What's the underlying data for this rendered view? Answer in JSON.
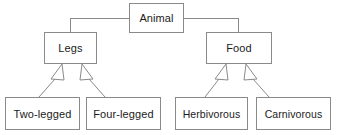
{
  "diagram": {
    "title": "Animal",
    "type": "generalization-hierarchy",
    "colors": {
      "background": "#ffffff",
      "box_border": "#8a8a8a",
      "box_fill": "#ffffff",
      "connector": "#8a8a8a",
      "arrowhead_fill": "#ffffff",
      "arrowhead_stroke": "#8a8a8a",
      "text": "#1b1b1b"
    },
    "nodes": {
      "root": {
        "id": "animal",
        "label": "Animal",
        "x": 129,
        "y": 3,
        "w": 55,
        "h": 30
      },
      "legs": {
        "id": "legs",
        "label": "Legs",
        "x": 44,
        "y": 32,
        "w": 53,
        "h": 32
      },
      "food": {
        "id": "food",
        "label": "Food",
        "x": 206,
        "y": 32,
        "w": 66,
        "h": 32
      },
      "two_legged": {
        "id": "two-legged",
        "label": "Two-legged",
        "x": 5,
        "y": 97,
        "w": 75,
        "h": 33
      },
      "four_legged": {
        "id": "four-legged",
        "label": "Four-legged",
        "x": 86,
        "y": 97,
        "w": 75,
        "h": 33
      },
      "herbivorous": {
        "id": "herbivorous",
        "label": "Herbivorous",
        "x": 175,
        "y": 97,
        "w": 73,
        "h": 33
      },
      "carnivorous": {
        "id": "carnivorous",
        "label": "Carnivorous",
        "x": 256,
        "y": 97,
        "w": 75,
        "h": 33
      }
    },
    "edges": [
      {
        "from": "animal",
        "to": "legs",
        "style": "orthogonal",
        "arrow": "none"
      },
      {
        "from": "animal",
        "to": "food",
        "style": "orthogonal",
        "arrow": "none"
      },
      {
        "from": "legs",
        "to": "two-legged",
        "style": "diagonal",
        "arrow": "hollow-triangle"
      },
      {
        "from": "legs",
        "to": "four-legged",
        "style": "diagonal",
        "arrow": "hollow-triangle"
      },
      {
        "from": "food",
        "to": "herbivorous",
        "style": "diagonal",
        "arrow": "hollow-triangle"
      },
      {
        "from": "food",
        "to": "carnivorous",
        "style": "diagonal",
        "arrow": "hollow-triangle"
      }
    ]
  }
}
